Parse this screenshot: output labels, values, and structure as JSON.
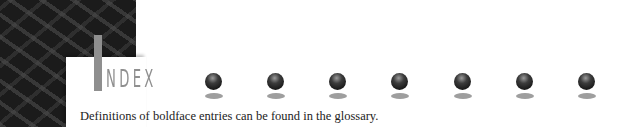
{
  "header": {
    "title_initial": "I",
    "title_rest": "NDEX",
    "title_color": "#8f8f8f"
  },
  "decor": {
    "sphere_count": 7,
    "sphere_centers_x": [
      214,
      276,
      338,
      400,
      463,
      525,
      587
    ]
  },
  "note": "Definitions of boldface entries can be found in the glossary."
}
